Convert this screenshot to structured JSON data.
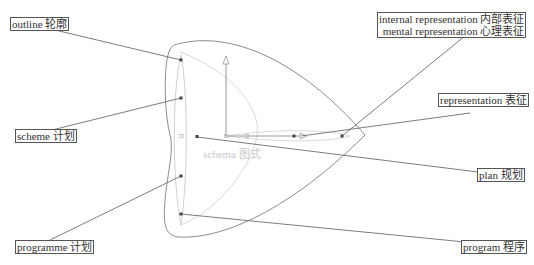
{
  "labels": {
    "outline": "outline 轮廓",
    "internal_representation": "internal representation 内部表征",
    "mental_representation": "mental representation 心理表征",
    "representation": "representation 表征",
    "scheme": "scheme 计划",
    "plan": "plan 规划",
    "programme": "programme 计划",
    "program": "program 程序",
    "schema": "schema 图式"
  },
  "colors": {
    "outer_shape": "#8c8c8c",
    "inner_shape": "#d8d8d8",
    "leader_line": "#6e6e6e",
    "node": "#444444",
    "label_border": "#555555",
    "center_label": "#c8c8c8"
  }
}
